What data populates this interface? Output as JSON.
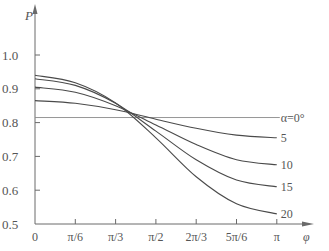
{
  "chart_data": {
    "type": "line",
    "title": "",
    "xlabel": "φ",
    "ylabel": "P",
    "xlim": [
      0,
      3.14159
    ],
    "ylim": [
      0.5,
      1.05
    ],
    "grid": false,
    "legend_position": "inline-right",
    "x_tick_labels": [
      "0",
      "π/6",
      "π/3",
      "π/2",
      "2π/3",
      "5π/6",
      "π"
    ],
    "y_tick_labels": [
      "0.5",
      "0.6",
      "0.7",
      "0.8",
      "0.9",
      "1.0"
    ],
    "x": [
      0,
      0.5236,
      1.0472,
      1.5708,
      2.0944,
      2.618,
      3.1416
    ],
    "series": [
      {
        "name": "α=0°",
        "label": "α=0°",
        "values": [
          0.815,
          0.815,
          0.815,
          0.815,
          0.815,
          0.815,
          0.815
        ]
      },
      {
        "name": "α=5°",
        "label": "5",
        "values": [
          0.865,
          0.857,
          0.838,
          0.81,
          0.783,
          0.763,
          0.755
        ]
      },
      {
        "name": "α=10°",
        "label": "10",
        "values": [
          0.905,
          0.89,
          0.85,
          0.793,
          0.735,
          0.69,
          0.675
        ]
      },
      {
        "name": "α=15°",
        "label": "15",
        "values": [
          0.93,
          0.91,
          0.857,
          0.775,
          0.69,
          0.63,
          0.61
        ]
      },
      {
        "name": "α=20°",
        "label": "20",
        "values": [
          0.94,
          0.918,
          0.858,
          0.755,
          0.64,
          0.56,
          0.53
        ]
      }
    ]
  },
  "axes": {
    "x_symbol": "φ",
    "y_symbol": "P"
  }
}
